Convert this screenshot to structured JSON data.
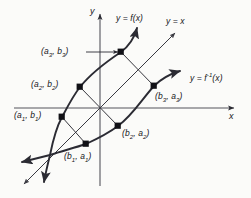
{
  "figure": {
    "background_color": "#fbfbf9",
    "ink_color": "#2b2b33",
    "axes": {
      "x_label": "x",
      "y_label": "y",
      "origin": [
        100,
        108
      ]
    },
    "curve_labels": {
      "f": "y = f(x)",
      "identity": "y = x",
      "f_inverse_prefix": "y = f",
      "f_inverse_exponent": "-1",
      "f_inverse_suffix": "(x)"
    },
    "points": [
      {
        "name": "point-a3-b3",
        "label_open": "(a",
        "label_sub1": "3",
        "label_mid": ", b",
        "label_sub2": "3",
        "label_close": ")",
        "x": 121,
        "y": 52
      },
      {
        "name": "point-a2-b2",
        "label_open": "(a",
        "label_sub1": "2",
        "label_mid": ", b",
        "label_sub2": "2",
        "label_close": ")",
        "x": 80,
        "y": 87
      },
      {
        "name": "point-a1-b1",
        "label_open": "(a",
        "label_sub1": "1",
        "label_mid": ", b",
        "label_sub2": "1",
        "label_close": ")",
        "x": 62,
        "y": 117
      },
      {
        "name": "point-b3-a3",
        "label_open": "(b",
        "label_sub1": "3",
        "label_mid": ", a",
        "label_sub2": "3",
        "label_close": ")",
        "x": 154,
        "y": 86
      },
      {
        "name": "point-b2-a2",
        "label_open": "(b",
        "label_sub1": "2",
        "label_mid": ", a",
        "label_sub2": "2",
        "label_close": ")",
        "x": 118,
        "y": 126
      },
      {
        "name": "point-b1-a1",
        "label_open": "(b",
        "label_sub1": "1",
        "label_mid": ", a",
        "label_sub2": "1",
        "label_close": ")",
        "x": 86,
        "y": 144
      }
    ],
    "point_labels": {
      "a3b3": "(a3, b3)",
      "a2b2": "(a2, b2)",
      "a1b1": "(a1, b1)",
      "b3a3": "(b3, a3)",
      "b2a2": "(b2, a2)",
      "b1a1": "(b1, a1)"
    }
  }
}
